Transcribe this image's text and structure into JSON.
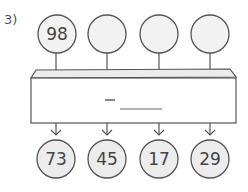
{
  "problem": {
    "number_label": "3)",
    "input": {
      "value": "98"
    },
    "inputs": [
      "98",
      "",
      "",
      ""
    ],
    "machine": {
      "operator": "−",
      "operand_blank": ""
    },
    "outputs": [
      "73",
      "45",
      "17",
      "29"
    ]
  },
  "colors": {
    "stroke": "#555555",
    "circle_fill": "#f0f0f0",
    "text": "#444444"
  }
}
